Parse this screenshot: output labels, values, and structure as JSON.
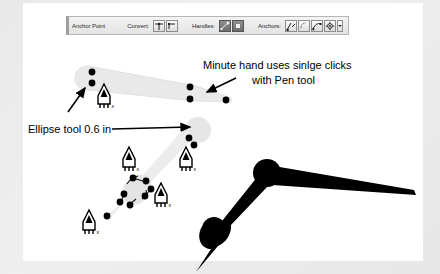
{
  "app": {
    "canvas_background": "#ffffff",
    "frame_color": "#e9e9ea"
  },
  "toolbar": {
    "title_label": "Anchor Point",
    "convert_label": "Convert:",
    "handles_label": "Handles:",
    "anchors_label": "Anchors:",
    "convert_buttons": [
      {
        "name": "convert-smooth-icon",
        "active": false
      },
      {
        "name": "convert-corner-icon",
        "active": false
      }
    ],
    "handles_buttons": [
      {
        "name": "handles-show-icon",
        "active": true
      },
      {
        "name": "handles-hide-icon",
        "active": true
      }
    ],
    "anchors_buttons": [
      {
        "name": "anchor-add-icon",
        "active": false
      },
      {
        "name": "anchor-delete-icon",
        "active": false
      },
      {
        "name": "anchor-convert-icon",
        "active": false
      },
      {
        "name": "anchor-options-icon",
        "active": false
      }
    ],
    "anchors_caret": "▾"
  },
  "annotations": {
    "minute_hand": {
      "line1": "Minute hand uses sinlge clicks",
      "line2": "with Pen tool"
    },
    "ellipse_tool": {
      "text": "Ellipse tool 0.6 in"
    }
  },
  "artwork": {
    "minute_hand_outline": {
      "fill": "#e8e8e8",
      "anchor_points": [
        {
          "x": 89,
          "y": 72
        },
        {
          "x": 89,
          "y": 83
        },
        {
          "x": 191,
          "y": 86
        },
        {
          "x": 191,
          "y": 99
        },
        {
          "x": 227,
          "y": 100
        }
      ]
    },
    "hour_hand_outline": {
      "fill": "#e5e5e5",
      "anchor_points": [
        {
          "x": 188,
          "y": 139
        },
        {
          "x": 194,
          "y": 145
        },
        {
          "x": 133,
          "y": 178
        },
        {
          "x": 146,
          "y": 182
        },
        {
          "x": 151,
          "y": 189
        },
        {
          "x": 124,
          "y": 195
        },
        {
          "x": 145,
          "y": 196
        },
        {
          "x": 120,
          "y": 203
        },
        {
          "x": 129,
          "y": 205
        },
        {
          "x": 107,
          "y": 216
        }
      ]
    },
    "clock_hands_solid": {
      "fill": "#000000",
      "hub": {
        "x": 267,
        "y": 172,
        "r": 13
      },
      "minute_tip": {
        "x": 414,
        "y": 192
      },
      "hour_hub": {
        "x": 214,
        "y": 228,
        "r": 11
      },
      "hour_tip": {
        "x": 196,
        "y": 259
      }
    },
    "pen_cursors": [
      {
        "x": 103,
        "y": 90
      },
      {
        "x": 128,
        "y": 153
      },
      {
        "x": 185,
        "y": 153
      },
      {
        "x": 160,
        "y": 189
      },
      {
        "x": 88,
        "y": 216
      }
    ],
    "pen_cursor_badge": "x",
    "arrows": [
      {
        "name": "arrow-to-minute-hand-hub",
        "from": {
          "x": 66,
          "y": 109
        },
        "to": {
          "x": 84,
          "y": 88
        }
      },
      {
        "name": "arrow-to-minute-hand-tip",
        "from": {
          "x": 233,
          "y": 79
        },
        "to": {
          "x": 206,
          "y": 92
        }
      },
      {
        "name": "arrow-ellipse-leader",
        "from": {
          "x": 115,
          "y": 129
        },
        "to": {
          "x": 190,
          "y": 129
        }
      }
    ]
  }
}
